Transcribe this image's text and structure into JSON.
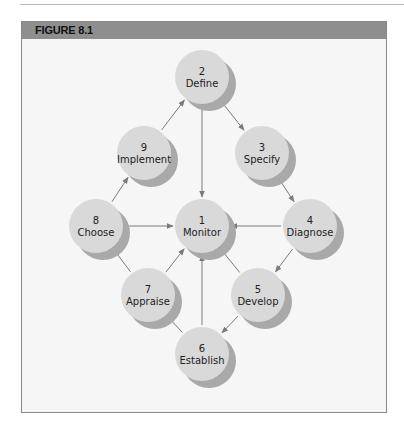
{
  "figure": {
    "title": "FIGURE 8.1",
    "colors": {
      "header": "#8e8e8e",
      "background": "#f6f6f6",
      "node_fill": "#d9d9d9",
      "node_shadow": "#a9a9a9",
      "arrow": "#7a7a7a"
    }
  },
  "nodes": [
    {
      "id": "monitor",
      "number": "1",
      "label": "Monitor",
      "cx": 202,
      "cy": 226
    },
    {
      "id": "define",
      "number": "2",
      "label": "Define",
      "cx": 202,
      "cy": 77
    },
    {
      "id": "specify",
      "number": "3",
      "label": "Specify",
      "cx": 262,
      "cy": 153
    },
    {
      "id": "diagnose",
      "number": "4",
      "label": "Diagnose",
      "cx": 310,
      "cy": 226
    },
    {
      "id": "develop",
      "number": "5",
      "label": "Develop",
      "cx": 258,
      "cy": 295
    },
    {
      "id": "establish",
      "number": "6",
      "label": "Establish",
      "cx": 202,
      "cy": 354
    },
    {
      "id": "appraise",
      "number": "7",
      "label": "Appraise",
      "cx": 148,
      "cy": 295
    },
    {
      "id": "choose",
      "number": "8",
      "label": "Choose",
      "cx": 96,
      "cy": 226
    },
    {
      "id": "implement",
      "number": "9",
      "label": "Implement",
      "cx": 144,
      "cy": 153
    }
  ],
  "edges": [
    {
      "from": "define",
      "to": "specify"
    },
    {
      "from": "specify",
      "to": "diagnose"
    },
    {
      "from": "diagnose",
      "to": "develop"
    },
    {
      "from": "develop",
      "to": "establish"
    },
    {
      "from": "establish",
      "to": "appraise"
    },
    {
      "from": "appraise",
      "to": "choose"
    },
    {
      "from": "choose",
      "to": "implement"
    },
    {
      "from": "implement",
      "to": "define"
    },
    {
      "from": "define",
      "to": "monitor"
    },
    {
      "from": "diagnose",
      "to": "monitor"
    },
    {
      "from": "choose",
      "to": "monitor"
    },
    {
      "from": "establish",
      "to": "monitor"
    },
    {
      "from": "appraise",
      "to": "monitor"
    },
    {
      "from": "develop",
      "to": "monitor"
    }
  ]
}
